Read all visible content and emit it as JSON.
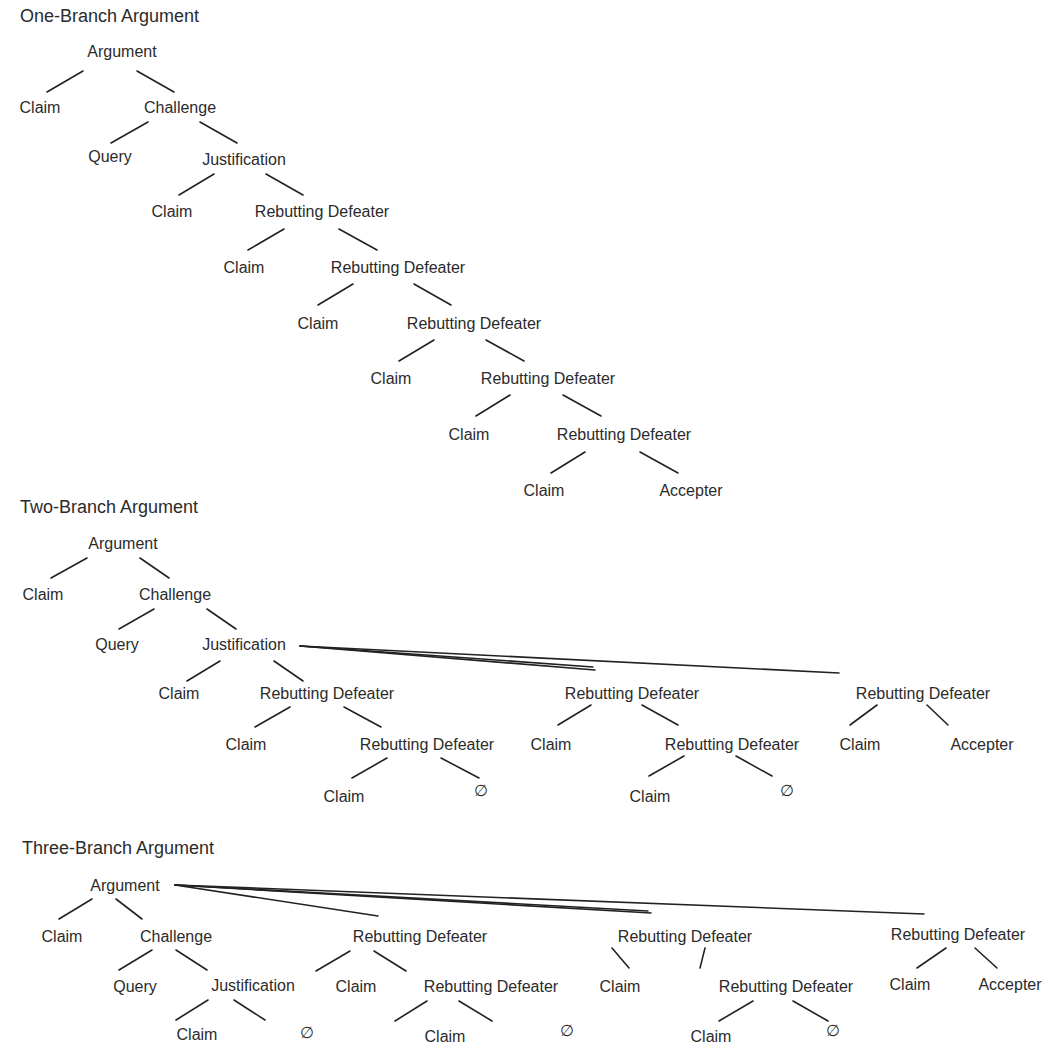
{
  "colors": {
    "text": "#2b2b2b",
    "line": "#222222",
    "background": "#ffffff"
  },
  "diagrams": [
    {
      "title": "One-Branch Argument",
      "title_pos": [
        20,
        22
      ],
      "nodes": [
        {
          "label": "Argument",
          "x": 122,
          "y": 57
        },
        {
          "label": "Claim",
          "x": 40,
          "y": 113
        },
        {
          "label": "Challenge",
          "x": 180,
          "y": 113
        },
        {
          "label": "Query",
          "x": 110,
          "y": 162
        },
        {
          "label": "Justification",
          "x": 244,
          "y": 165
        },
        {
          "label": "Claim",
          "x": 172,
          "y": 217
        },
        {
          "label": "Rebutting Defeater",
          "x": 322,
          "y": 217
        },
        {
          "label": "Claim",
          "x": 244,
          "y": 273
        },
        {
          "label": "Rebutting Defeater",
          "x": 398,
          "y": 273
        },
        {
          "label": "Claim",
          "x": 318,
          "y": 329
        },
        {
          "label": "Rebutting Defeater",
          "x": 474,
          "y": 329
        },
        {
          "label": "Claim",
          "x": 391,
          "y": 384
        },
        {
          "label": "Rebutting Defeater",
          "x": 548,
          "y": 384
        },
        {
          "label": "Claim",
          "x": 469,
          "y": 440
        },
        {
          "label": "Rebutting Defeater",
          "x": 624,
          "y": 440
        },
        {
          "label": "Claim",
          "x": 544,
          "y": 496
        },
        {
          "label": "Accepter",
          "x": 691,
          "y": 496
        }
      ],
      "edges": [
        [
          83,
          71,
          47,
          92
        ],
        [
          137,
          71,
          174,
          92
        ],
        [
          148,
          122,
          111,
          143
        ],
        [
          200,
          122,
          237,
          143
        ],
        [
          214,
          174,
          179,
          195
        ],
        [
          266,
          174,
          303,
          195
        ],
        [
          284,
          229,
          248,
          250
        ],
        [
          339,
          229,
          377,
          250
        ],
        [
          353,
          284,
          318,
          305
        ],
        [
          414,
          284,
          451,
          305
        ],
        [
          434,
          340,
          399,
          361
        ],
        [
          486,
          340,
          524,
          361
        ],
        [
          510,
          395,
          476,
          416
        ],
        [
          563,
          395,
          601,
          416
        ],
        [
          585,
          452,
          551,
          473
        ],
        [
          640,
          452,
          678,
          473
        ]
      ]
    },
    {
      "title": "Two-Branch Argument",
      "title_pos": [
        20,
        513
      ],
      "nodes": [
        {
          "label": "Argument",
          "x": 123,
          "y": 549
        },
        {
          "label": "Claim",
          "x": 43,
          "y": 600
        },
        {
          "label": "Challenge",
          "x": 175,
          "y": 600
        },
        {
          "label": "Query",
          "x": 117,
          "y": 650
        },
        {
          "label": "Justification",
          "x": 244,
          "y": 650
        },
        {
          "label": "Claim",
          "x": 179,
          "y": 699
        },
        {
          "label": "Rebutting Defeater",
          "x": 327,
          "y": 699
        },
        {
          "label": "Claim",
          "x": 246,
          "y": 750
        },
        {
          "label": "Rebutting Defeater",
          "x": 427,
          "y": 750
        },
        {
          "label": "Claim",
          "x": 344,
          "y": 802
        },
        {
          "label": "∅",
          "x": 481,
          "y": 796
        },
        {
          "label": "Rebutting Defeater",
          "x": 632,
          "y": 699
        },
        {
          "label": "Claim",
          "x": 551,
          "y": 750
        },
        {
          "label": "Rebutting Defeater",
          "x": 732,
          "y": 750
        },
        {
          "label": "Claim",
          "x": 650,
          "y": 802
        },
        {
          "label": "∅",
          "x": 787,
          "y": 796
        },
        {
          "label": "Rebutting Defeater",
          "x": 923,
          "y": 699
        },
        {
          "label": "Claim",
          "x": 860,
          "y": 750
        },
        {
          "label": "Accepter",
          "x": 982,
          "y": 750
        }
      ],
      "edges": [
        [
          87,
          558,
          51,
          578
        ],
        [
          140,
          558,
          169,
          578
        ],
        [
          154,
          609,
          119,
          629
        ],
        [
          207,
          609,
          236,
          629
        ],
        [
          220,
          661,
          187,
          681
        ],
        [
          274,
          661,
          303,
          681
        ],
        [
          290,
          707,
          255,
          727
        ],
        [
          344,
          707,
          381,
          727
        ],
        [
          387,
          758,
          352,
          778
        ],
        [
          441,
          758,
          479,
          778
        ],
        [
          591,
          705,
          558,
          725
        ],
        [
          642,
          705,
          678,
          725
        ],
        [
          684,
          756,
          649,
          776
        ],
        [
          736,
          756,
          772,
          776
        ],
        [
          877,
          705,
          850,
          725
        ],
        [
          927,
          705,
          948,
          725
        ],
        [
          300,
          646,
          593,
          667
        ],
        [
          300,
          646,
          595,
          670
        ],
        [
          300,
          646,
          839,
          673
        ]
      ]
    },
    {
      "title": "Three-Branch Argument",
      "title_pos": [
        22,
        854
      ],
      "nodes": [
        {
          "label": "Argument",
          "x": 125,
          "y": 891
        },
        {
          "label": "Claim",
          "x": 62,
          "y": 942
        },
        {
          "label": "Challenge",
          "x": 176,
          "y": 942
        },
        {
          "label": "Query",
          "x": 135,
          "y": 992
        },
        {
          "label": "Justification",
          "x": 253,
          "y": 991
        },
        {
          "label": "Claim",
          "x": 197,
          "y": 1040
        },
        {
          "label": "∅",
          "x": 307,
          "y": 1038
        },
        {
          "label": "Rebutting Defeater",
          "x": 420,
          "y": 942
        },
        {
          "label": "Claim",
          "x": 356,
          "y": 992
        },
        {
          "label": "Rebutting Defeater",
          "x": 491,
          "y": 992
        },
        {
          "label": "Claim",
          "x": 445,
          "y": 1042
        },
        {
          "label": "∅",
          "x": 567,
          "y": 1036
        },
        {
          "label": "Rebutting Defeater",
          "x": 685,
          "y": 942
        },
        {
          "label": "Claim",
          "x": 620,
          "y": 992
        },
        {
          "label": "Rebutting Defeater",
          "x": 786,
          "y": 992
        },
        {
          "label": "Claim",
          "x": 711,
          "y": 1042
        },
        {
          "label": "∅",
          "x": 833,
          "y": 1036
        },
        {
          "label": "Rebutting Defeater",
          "x": 958,
          "y": 940
        },
        {
          "label": "Claim",
          "x": 910,
          "y": 990
        },
        {
          "label": "Accepter",
          "x": 1010,
          "y": 990
        }
      ],
      "edges": [
        [
          92,
          899,
          59,
          919
        ],
        [
          116,
          899,
          142,
          919
        ],
        [
          152,
          950,
          119,
          970
        ],
        [
          176,
          950,
          207,
          970
        ],
        [
          208,
          1000,
          176,
          1020
        ],
        [
          234,
          1000,
          265,
          1020
        ],
        [
          350,
          951,
          316,
          971
        ],
        [
          374,
          951,
          406,
          971
        ],
        [
          427,
          1001,
          395,
          1021
        ],
        [
          459,
          1001,
          492,
          1021
        ],
        [
          612,
          948,
          629,
          968
        ],
        [
          705,
          948,
          700,
          968
        ],
        [
          753,
          1001,
          719,
          1021
        ],
        [
          793,
          1001,
          828,
          1021
        ],
        [
          946,
          948,
          917,
          968
        ],
        [
          975,
          948,
          997,
          968
        ],
        [
          175,
          885,
          378,
          916
        ],
        [
          175,
          885,
          651,
          913
        ],
        [
          175,
          885,
          924,
          914
        ],
        [
          175,
          885,
          648,
          911
        ]
      ]
    }
  ]
}
